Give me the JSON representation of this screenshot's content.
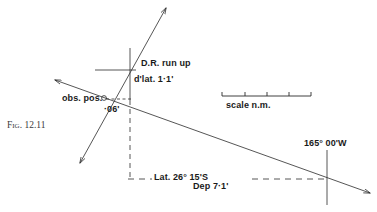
{
  "figure": {
    "caption": "Fig. 12.11",
    "title_role": "navigation-plot-diagram"
  },
  "labels": {
    "dr_run_up": "D.R. run up",
    "dlat": "d'lat. 1·1'",
    "obs_pos": "obs. pos.",
    "obs_pos_minutes": "·06'",
    "scale": "scale  n.m.",
    "longitude": "165° 00'W",
    "latitude": "Lat.  26° 15'S",
    "departure": "Dep  7·1'"
  },
  "colors": {
    "ink": "#2b2b2b",
    "caption_ink": "#3a3a3a",
    "background": "#ffffff"
  },
  "geometry": {
    "position_line": {
      "name": "position-line",
      "from": [
        55,
        80
      ],
      "to": [
        370,
        193
      ],
      "arrow_start": true,
      "arrow_end": true
    },
    "course_line": {
      "name": "course-line",
      "from": [
        80,
        163
      ],
      "to": [
        166,
        8
      ],
      "arrow_start": true,
      "arrow_end": true
    },
    "meridian_left": {
      "name": "meridian-left-dashed",
      "x": 130,
      "y_top": 100,
      "y_bottom": 179
    },
    "meridian_right": {
      "name": "meridian-right",
      "x": 327,
      "y_top": 150,
      "y_bottom": 205
    },
    "parallel_dr": {
      "name": "parallel-through-dr",
      "y": 70,
      "x_left": 95,
      "x_right": 136
    },
    "meridian_dr": {
      "name": "meridian-through-dr",
      "x": 130,
      "y_top": 48,
      "y_bottom": 100
    },
    "parallel_bottom_dashed": {
      "name": "parallel-bottom-dashed",
      "y": 179,
      "x_left": 128,
      "x_right": 327
    },
    "dep_tick_dashed": {
      "name": "departure-tick-dashed",
      "y": 99,
      "x_left": 106,
      "x_right": 133
    },
    "scale_bar": {
      "name": "scale-bar",
      "y": 96,
      "x_left": 222,
      "x_right": 311,
      "ticks": [
        222,
        245,
        267,
        289,
        311
      ]
    }
  }
}
